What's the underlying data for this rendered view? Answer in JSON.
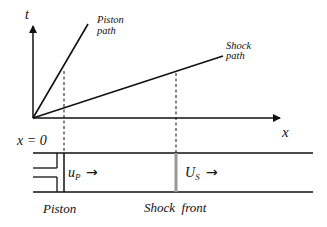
{
  "diagram": {
    "axes": {
      "t_label": "t",
      "x_label": "x",
      "origin_label": "x = 0"
    },
    "paths": {
      "piston_path_line1": "Piston",
      "piston_path_line2": "path",
      "shock_path_line1": "Shock",
      "shock_path_line2": "path"
    },
    "tube": {
      "piston_velocity": "u",
      "piston_velocity_sub": "P",
      "shock_velocity": "U",
      "shock_velocity_sub": "S",
      "arrow": "→",
      "piston_label": "Piston",
      "shock_front_label": "Shock  front"
    },
    "colors": {
      "line": "#111111",
      "shock_front": "#999999"
    }
  }
}
